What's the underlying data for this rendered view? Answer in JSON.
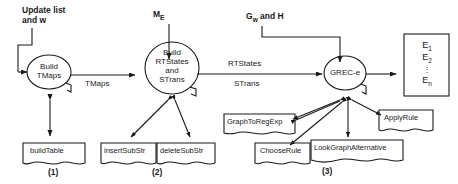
{
  "diagram": {
    "stroke_color": "#1a1a1a",
    "text_color": "#1a1a1a",
    "background": "#ffffff"
  },
  "inputs": [
    {
      "id": "update-list",
      "text_line1": "Update list",
      "text_line2": "and w"
    },
    {
      "id": "me",
      "base": "M",
      "subscript": "E"
    },
    {
      "id": "gw-h",
      "base": "G",
      "subscript": "w",
      "suffix": " and H"
    }
  ],
  "processes": [
    {
      "id": "build-tmaps",
      "lines": [
        "Build",
        "TMaps"
      ]
    },
    {
      "id": "build-rtstates",
      "lines": [
        "Build",
        "RTStates",
        "and",
        "STrans"
      ]
    },
    {
      "id": "grec-e",
      "lines": [
        "GREC-e"
      ]
    }
  ],
  "flows": [
    {
      "id": "tmaps-flow",
      "label": "TMaps"
    },
    {
      "id": "rtstates-flow",
      "label": "RTStates"
    },
    {
      "id": "strans-flow",
      "label": "STrans"
    }
  ],
  "datastores": [
    {
      "id": "build-table",
      "label": "buildTable",
      "group": "1"
    },
    {
      "id": "insert-substr",
      "label": "insertSubStr",
      "group": "2"
    },
    {
      "id": "delete-substr",
      "label": "deleteSubStr",
      "group": "2"
    },
    {
      "id": "graph-to-regexp",
      "label": "GraphToRegExp",
      "group": "3"
    },
    {
      "id": "choose-rule",
      "label": "ChooseRule",
      "group": "3"
    },
    {
      "id": "look-graph-alternative",
      "label": "LookGraphAlternative",
      "group": "3"
    },
    {
      "id": "apply-rule",
      "label": "ApplyRule",
      "group": "3"
    }
  ],
  "groups": [
    {
      "id": "group-1",
      "label": "(1)"
    },
    {
      "id": "group-2",
      "label": "(2)"
    },
    {
      "id": "group-3",
      "label": "(3)"
    }
  ],
  "output": {
    "id": "entity-list",
    "items": [
      {
        "base": "E",
        "subscript": "1"
      },
      {
        "base": "E",
        "subscript": "2"
      },
      {
        "base": "",
        "subscript": ""
      },
      {
        "base": "E",
        "subscript": "n"
      }
    ],
    "ellipsis": "⋮"
  }
}
